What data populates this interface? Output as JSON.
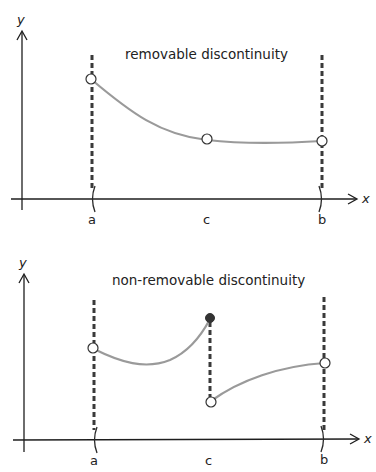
{
  "panels": [
    {
      "title": "removable discontinuity",
      "axis_labels": {
        "x": "x",
        "y": "y"
      },
      "tick_labels": {
        "a": "a",
        "c": "c",
        "b": "b"
      }
    },
    {
      "title": "non-removable discontinuity",
      "axis_labels": {
        "x": "x",
        "y": "y"
      },
      "tick_labels": {
        "a": "a",
        "c": "c",
        "b": "b"
      }
    }
  ],
  "colors": {
    "axis": "#1e1e1e",
    "dashed_line": "#3a3a3a",
    "curve": "#9a9a9a",
    "point": "#333333"
  }
}
